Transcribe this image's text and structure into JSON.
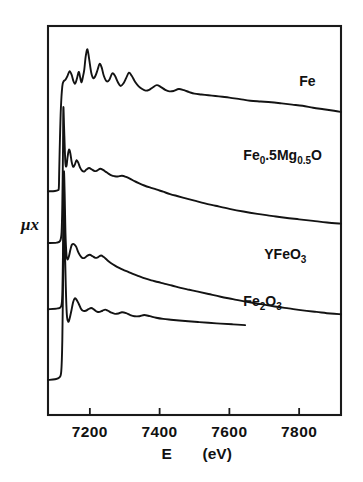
{
  "chart_data": {
    "type": "line",
    "title": "",
    "subtitle": "",
    "xlabel": "E   (eV)",
    "xlabel_symbol": "E",
    "xlabel_units": "(eV)",
    "ylabel": "μx",
    "xlim": [
      7080,
      7920
    ],
    "ylim": [
      0,
      1
    ],
    "xticks": [
      7200,
      7400,
      7600,
      7800
    ],
    "xticklabels": [
      "7200",
      "7400",
      "7600",
      "7800"
    ],
    "yticks": [],
    "yticklabels": [],
    "grid": false,
    "legend": "inline-annotations",
    "axis_color": "#1a1a1a",
    "curve_color": "#131313",
    "background": "#ffffff",
    "annotations": [
      {
        "text": "Fe",
        "x": 7800,
        "y": 0.845
      },
      {
        "text": "Fe0.5Mg0.5O",
        "x": 7640,
        "y": 0.655
      },
      {
        "text": "YFeO3",
        "x": 7700,
        "y": 0.4
      },
      {
        "text": "Fe2O3",
        "x": 7640,
        "y": 0.28
      }
    ],
    "series": [
      {
        "name": "Fe",
        "label": "Fe",
        "label_parts": [
          {
            "t": "Fe",
            "sub": false
          }
        ],
        "edge_energy": 7112,
        "baseline": 0.58,
        "x": [
          7080,
          7100,
          7108,
          7111,
          7112,
          7114,
          7117,
          7121,
          7125,
          7130,
          7136,
          7142,
          7148,
          7153,
          7158,
          7163,
          7168,
          7172,
          7176,
          7180,
          7184,
          7188,
          7193,
          7198,
          7204,
          7210,
          7216,
          7222,
          7228,
          7234,
          7240,
          7248,
          7256,
          7264,
          7272,
          7280,
          7288,
          7296,
          7304,
          7312,
          7320,
          7330,
          7340,
          7350,
          7360,
          7370,
          7380,
          7392,
          7404,
          7416,
          7428,
          7440,
          7455,
          7470,
          7485,
          7500,
          7520,
          7540,
          7560,
          7580,
          7600,
          7630,
          7660,
          7690,
          7720,
          7750,
          7780,
          7810,
          7840,
          7870,
          7900,
          7920
        ],
        "y": [
          0.575,
          0.576,
          0.578,
          0.583,
          0.62,
          0.7,
          0.79,
          0.845,
          0.858,
          0.862,
          0.872,
          0.884,
          0.874,
          0.858,
          0.852,
          0.865,
          0.882,
          0.869,
          0.855,
          0.869,
          0.888,
          0.921,
          0.94,
          0.915,
          0.88,
          0.866,
          0.872,
          0.887,
          0.903,
          0.893,
          0.872,
          0.858,
          0.862,
          0.878,
          0.872,
          0.856,
          0.846,
          0.852,
          0.866,
          0.88,
          0.872,
          0.856,
          0.845,
          0.838,
          0.834,
          0.836,
          0.842,
          0.848,
          0.843,
          0.836,
          0.832,
          0.833,
          0.838,
          0.835,
          0.83,
          0.826,
          0.824,
          0.822,
          0.82,
          0.818,
          0.816,
          0.812,
          0.808,
          0.806,
          0.804,
          0.801,
          0.798,
          0.795,
          0.79,
          0.786,
          0.782,
          0.779
        ]
      },
      {
        "name": "Fe0.5Mg0.5O",
        "label": "Fe0.5Mg0.5O",
        "label_parts": [
          {
            "t": "Fe",
            "sub": false
          },
          {
            "t": "0",
            "sub": true
          },
          {
            "t": ".5",
            "sub": false
          },
          {
            "t": "Mg",
            "sub": false
          },
          {
            "t": "0.5",
            "sub": true
          },
          {
            "t": "O",
            "sub": false
          }
        ],
        "edge_energy": 7124,
        "baseline": 0.445,
        "x": [
          7080,
          7105,
          7115,
          7119,
          7121,
          7123,
          7124,
          7126,
          7128,
          7130,
          7133,
          7136,
          7140,
          7144,
          7148,
          7152,
          7157,
          7162,
          7167,
          7172,
          7178,
          7184,
          7190,
          7198,
          7206,
          7214,
          7222,
          7230,
          7238,
          7246,
          7254,
          7262,
          7270,
          7280,
          7292,
          7304,
          7316,
          7328,
          7340,
          7356,
          7372,
          7390,
          7410,
          7430,
          7450,
          7475,
          7500,
          7530,
          7560,
          7600,
          7640,
          7680,
          7720,
          7760,
          7800,
          7840,
          7880,
          7920
        ],
        "y": [
          0.442,
          0.443,
          0.448,
          0.47,
          0.54,
          0.68,
          0.79,
          0.742,
          0.688,
          0.646,
          0.64,
          0.662,
          0.682,
          0.673,
          0.65,
          0.638,
          0.644,
          0.655,
          0.648,
          0.636,
          0.628,
          0.626,
          0.631,
          0.635,
          0.631,
          0.627,
          0.629,
          0.633,
          0.63,
          0.625,
          0.62,
          0.616,
          0.614,
          0.613,
          0.615,
          0.612,
          0.607,
          0.601,
          0.596,
          0.59,
          0.585,
          0.58,
          0.574,
          0.568,
          0.563,
          0.557,
          0.551,
          0.544,
          0.538,
          0.53,
          0.523,
          0.517,
          0.512,
          0.507,
          0.503,
          0.499,
          0.495,
          0.492
        ]
      },
      {
        "name": "YFeO3",
        "label": "YFeO3",
        "label_parts": [
          {
            "t": "YFeO",
            "sub": false
          },
          {
            "t": "3",
            "sub": true
          }
        ],
        "edge_energy": 7126,
        "baseline": 0.275,
        "x": [
          7080,
          7108,
          7118,
          7121,
          7123,
          7125,
          7126,
          7128,
          7130,
          7133,
          7136,
          7140,
          7144,
          7148,
          7152,
          7156,
          7161,
          7166,
          7172,
          7178,
          7185,
          7192,
          7200,
          7208,
          7216,
          7224,
          7232,
          7240,
          7250,
          7260,
          7272,
          7284,
          7296,
          7310,
          7325,
          7340,
          7358,
          7376,
          7395,
          7415,
          7435,
          7460,
          7485,
          7510,
          7540,
          7575,
          7610,
          7650,
          7690,
          7730,
          7770,
          7810,
          7850,
          7890,
          7920
        ],
        "y": [
          0.272,
          0.274,
          0.28,
          0.31,
          0.42,
          0.59,
          0.625,
          0.56,
          0.47,
          0.412,
          0.4,
          0.408,
          0.424,
          0.437,
          0.44,
          0.438,
          0.432,
          0.42,
          0.41,
          0.404,
          0.404,
          0.409,
          0.412,
          0.408,
          0.404,
          0.406,
          0.41,
          0.406,
          0.398,
          0.391,
          0.384,
          0.378,
          0.373,
          0.368,
          0.362,
          0.357,
          0.351,
          0.346,
          0.342,
          0.337,
          0.333,
          0.327,
          0.322,
          0.317,
          0.311,
          0.304,
          0.298,
          0.291,
          0.285,
          0.279,
          0.274,
          0.269,
          0.265,
          0.261,
          0.259
        ]
      },
      {
        "name": "Fe2O3",
        "label": "Fe2O3",
        "label_parts": [
          {
            "t": "Fe",
            "sub": false
          },
          {
            "t": "2",
            "sub": true
          },
          {
            "t": "O",
            "sub": false
          },
          {
            "t": "3",
            "sub": true
          }
        ],
        "edge_energy": 7126,
        "baseline": 0.1,
        "x": [
          7080,
          7100,
          7112,
          7118,
          7121,
          7124,
          7126,
          7128,
          7131,
          7134,
          7138,
          7142,
          7147,
          7152,
          7157,
          7162,
          7168,
          7174,
          7180,
          7188,
          7196,
          7204,
          7212,
          7220,
          7228,
          7236,
          7244,
          7252,
          7262,
          7272,
          7282,
          7292,
          7304,
          7316,
          7328,
          7342,
          7356,
          7372,
          7390,
          7410,
          7432,
          7456,
          7482,
          7510,
          7540,
          7575,
          7610,
          7645
        ],
        "y": [
          0.09,
          0.092,
          0.096,
          0.112,
          0.19,
          0.4,
          0.53,
          0.455,
          0.33,
          0.258,
          0.24,
          0.248,
          0.268,
          0.29,
          0.3,
          0.296,
          0.286,
          0.274,
          0.268,
          0.268,
          0.272,
          0.275,
          0.271,
          0.266,
          0.265,
          0.268,
          0.271,
          0.268,
          0.263,
          0.26,
          0.261,
          0.264,
          0.262,
          0.257,
          0.254,
          0.254,
          0.257,
          0.254,
          0.25,
          0.247,
          0.245,
          0.243,
          0.241,
          0.239,
          0.237,
          0.235,
          0.233,
          0.231
        ]
      }
    ]
  },
  "figure": {
    "plot_frame": {
      "left": 48,
      "top": 26,
      "right": 341,
      "bottom": 415
    },
    "tick_length": 7
  }
}
